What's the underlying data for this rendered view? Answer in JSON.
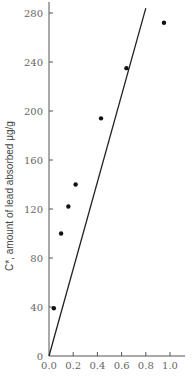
{
  "chart_data": {
    "type": "scatter",
    "title": "",
    "xlabel": "",
    "ylabel": "C*, amount of lead absorbed μg/g",
    "xlim": [
      0,
      1.1
    ],
    "ylim": [
      0,
      290
    ],
    "x_ticks": [
      "0.0",
      "0.2",
      "0.4",
      "0.6",
      "0.8",
      "1.0"
    ],
    "x_tick_values": [
      0,
      0.2,
      0.4,
      0.6,
      0.8,
      1.0
    ],
    "y_ticks": [
      "0",
      "40",
      "80",
      "120",
      "160",
      "200",
      "240",
      "280"
    ],
    "y_tick_values": [
      0,
      40,
      80,
      120,
      160,
      200,
      240,
      280
    ],
    "grid": false,
    "legend": null,
    "series": [
      {
        "name": "measured",
        "type": "scatter",
        "points": [
          {
            "x": 0.04,
            "y": 39
          },
          {
            "x": 0.1,
            "y": 100
          },
          {
            "x": 0.16,
            "y": 122
          },
          {
            "x": 0.22,
            "y": 140
          },
          {
            "x": 0.43,
            "y": 194
          },
          {
            "x": 0.64,
            "y": 235
          },
          {
            "x": 0.95,
            "y": 272
          }
        ]
      },
      {
        "name": "fit line",
        "type": "line",
        "points": [
          {
            "x": 0.0,
            "y": 0
          },
          {
            "x": 0.8,
            "y": 284
          }
        ]
      }
    ]
  }
}
